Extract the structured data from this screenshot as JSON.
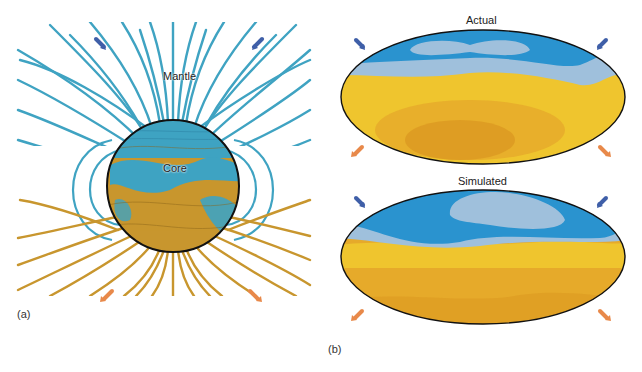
{
  "figure": {
    "panel_a": {
      "label": "(a)",
      "mantle_label": "Mantle",
      "core_label": "Core",
      "colors": {
        "field_blue": "#3fa3c2",
        "field_gold": "#c8962e",
        "core_outline": "#111111",
        "inward_arrow": "#3f5fa8",
        "outward_arrow": "#e8894a"
      }
    },
    "panel_b": {
      "label": "(b)",
      "maps": [
        {
          "title": "Actual"
        },
        {
          "title": "Simulated"
        }
      ],
      "colors": {
        "dark_blue": "#2a93cf",
        "light_blue": "#9fc0dc",
        "yellow": "#efc52e",
        "orange": "#e6aa2a",
        "dark_orange": "#dd9b22",
        "outline": "#111111"
      }
    }
  }
}
